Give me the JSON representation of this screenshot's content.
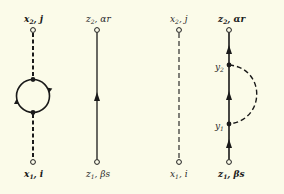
{
  "diagrams": [
    {
      "id": "a",
      "type": "dashed-line-with-loop",
      "top_label": {
        "var": "x",
        "sub": "2",
        "rest": ", j"
      },
      "bottom_label": {
        "var": "x",
        "sub": "1",
        "rest": ", i"
      }
    },
    {
      "id": "b",
      "type": "solid-line-with-arrow",
      "top_label": {
        "var": "z",
        "sub": "2",
        "rest": ", αr"
      },
      "bottom_label": {
        "var": "z",
        "sub": "1",
        "rest": ", βs"
      }
    },
    {
      "id": "c",
      "type": "dashed-line",
      "top_label": {
        "var": "x",
        "sub": "2",
        "rest": ", j"
      },
      "bottom_label": {
        "var": "x",
        "sub": "1",
        "rest": ", i"
      }
    },
    {
      "id": "d",
      "type": "solid-line-with-dashed-arc",
      "top_label": {
        "var": "z",
        "sub": "2",
        "rest": ", αr"
      },
      "bottom_label": {
        "var": "z",
        "sub": "1",
        "rest": ", βs"
      },
      "vertex_labels": [
        {
          "var": "y",
          "sub": "2"
        },
        {
          "var": "y",
          "sub": "1"
        }
      ]
    }
  ],
  "colors": {
    "background": "#fbfbe9",
    "ink": "#1a1a1a"
  }
}
